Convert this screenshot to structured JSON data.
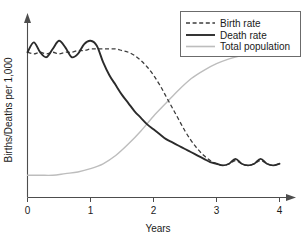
{
  "chart_data": {
    "type": "line",
    "title": "",
    "xlabel": "Years",
    "ylabel": "Births/Deaths per 1,000",
    "xlim": [
      0,
      4.15
    ],
    "ylim": [
      0,
      100
    ],
    "grid": false,
    "xticks": [
      0,
      1,
      2,
      3,
      4
    ],
    "xtick_labels": [
      "0",
      "1",
      "2",
      "3",
      "4"
    ],
    "yticks": [],
    "ytick_labels": [],
    "legend_position": "top-right",
    "series": [
      {
        "name": "Birth rate",
        "style": "dashed",
        "color": "#3d3d3d",
        "x": [
          0.0,
          0.1,
          0.2,
          0.3,
          0.4,
          0.5,
          0.6,
          0.7,
          0.8,
          0.9,
          1.0,
          1.1,
          1.2,
          1.3,
          1.4,
          1.5,
          1.6,
          1.7,
          1.8,
          1.9,
          2.0,
          2.1,
          2.2,
          2.3,
          2.4,
          2.5,
          2.6,
          2.7,
          2.8,
          2.9,
          3.0,
          3.1,
          3.2,
          3.3,
          3.4,
          3.5,
          3.6,
          3.7,
          3.8,
          3.9,
          4.0
        ],
        "y": [
          84,
          83,
          84,
          83,
          84,
          83,
          84,
          84,
          85,
          85,
          86,
          86,
          86,
          86,
          86,
          85,
          84,
          82,
          79,
          75,
          70,
          64,
          57,
          50,
          43,
          36,
          30,
          25,
          21,
          18,
          16,
          15,
          16,
          18,
          16,
          15,
          16,
          18,
          16,
          15,
          16
        ]
      },
      {
        "name": "Death rate",
        "style": "solid-bold",
        "color": "#2b2b2b",
        "x": [
          0.0,
          0.1,
          0.2,
          0.3,
          0.4,
          0.5,
          0.6,
          0.7,
          0.8,
          0.9,
          1.0,
          1.1,
          1.2,
          1.3,
          1.4,
          1.5,
          1.6,
          1.7,
          1.8,
          1.9,
          2.0,
          2.1,
          2.2,
          2.3,
          2.4,
          2.5,
          2.6,
          2.7,
          2.8,
          2.9,
          3.0,
          3.1,
          3.2,
          3.3,
          3.4,
          3.5,
          3.6,
          3.7,
          3.8,
          3.9,
          4.0
        ],
        "y": [
          84,
          90,
          84,
          81,
          86,
          91,
          87,
          81,
          83,
          89,
          91,
          88,
          78,
          70,
          64,
          58,
          53,
          48,
          44,
          40,
          37,
          34,
          31,
          29,
          27,
          25,
          23,
          21,
          19,
          17,
          16,
          15,
          16,
          19,
          16,
          15,
          16,
          19,
          16,
          15,
          16
        ]
      },
      {
        "name": "Total population",
        "style": "solid-light",
        "color": "#bdbdbd",
        "x": [
          0.0,
          0.2,
          0.4,
          0.6,
          0.8,
          1.0,
          1.2,
          1.4,
          1.6,
          1.8,
          2.0,
          2.2,
          2.4,
          2.6,
          2.8,
          3.0,
          3.2,
          3.4,
          3.6,
          3.8,
          4.0
        ],
        "y": [
          9,
          9,
          9,
          10,
          11,
          13,
          16,
          21,
          28,
          36,
          45,
          53,
          61,
          68,
          73,
          77,
          80,
          82,
          83,
          84,
          84
        ]
      }
    ]
  },
  "legend": {
    "entries": [
      {
        "label": "Birth rate"
      },
      {
        "label": "Death rate"
      },
      {
        "label": "Total population"
      }
    ]
  },
  "axes": {
    "x_title": "Years",
    "y_title": "Births/Deaths per 1,000",
    "x_tick_labels": [
      "0",
      "1",
      "2",
      "3",
      "4"
    ]
  }
}
